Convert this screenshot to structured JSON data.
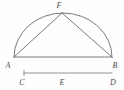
{
  "figure": {
    "background_color": "#fefefe",
    "stroke_color": "#6b6b6b",
    "label_color": "#4a4a4a",
    "labels": {
      "a": "A",
      "b": "B",
      "c": "C",
      "d": "D",
      "e": "E",
      "f": "F"
    },
    "geometry": {
      "point_a": {
        "x": 14,
        "y": 57
      },
      "point_b": {
        "x": 112,
        "y": 57
      },
      "point_f": {
        "x": 62,
        "y": 13
      },
      "segment_c": {
        "x": 24,
        "y": 73
      },
      "segment_d": {
        "x": 112,
        "y": 73
      },
      "arc_radius_x": 49,
      "arc_radius_y": 44
    },
    "elements": [
      {
        "name": "semicircle-arc",
        "type": "arc",
        "from": "A",
        "to": "B"
      },
      {
        "name": "baseline-ab",
        "type": "segment",
        "from": "A",
        "to": "B"
      },
      {
        "name": "chord-af",
        "type": "segment",
        "from": "A",
        "to": "F"
      },
      {
        "name": "chord-bf",
        "type": "segment",
        "from": "B",
        "to": "F"
      },
      {
        "name": "measure-segment-cd",
        "type": "segment",
        "from": "C",
        "to": "D"
      }
    ]
  }
}
